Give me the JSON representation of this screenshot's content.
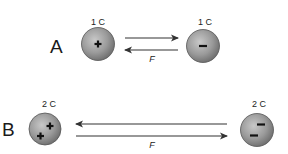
{
  "diagram": {
    "title": "",
    "scenarios": [
      {
        "id": "A",
        "label": "A",
        "left_charge": {
          "magnitude_label": "1 C",
          "sign": "+",
          "sign_count": 1
        },
        "right_charge": {
          "magnitude_label": "1 C",
          "sign": "-",
          "sign_count": 1
        },
        "force_label": "F",
        "force_direction": "attraction"
      },
      {
        "id": "B",
        "label": "B",
        "left_charge": {
          "magnitude_label": "2 C",
          "sign": "+",
          "sign_count": 2
        },
        "right_charge": {
          "magnitude_label": "2 C",
          "sign": "-",
          "sign_count": 2
        },
        "force_label": "F",
        "force_direction": "attraction"
      }
    ],
    "colors": {
      "sphere_fill": "#9a9a9a",
      "sphere_edge": "#555555",
      "arrow": "#333333"
    }
  }
}
